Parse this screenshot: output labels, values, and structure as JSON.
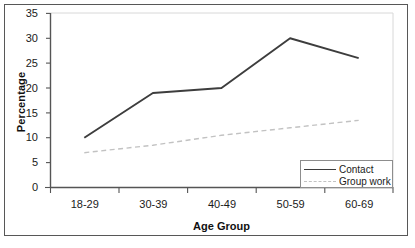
{
  "chart_data": {
    "type": "line",
    "title": "",
    "xlabel": "Age Group",
    "ylabel": "Percentage",
    "categories": [
      "18-29",
      "30-39",
      "40-49",
      "50-59",
      "60-69"
    ],
    "ylim": [
      0,
      35
    ],
    "yticks": [
      0,
      5,
      10,
      15,
      20,
      25,
      30,
      35
    ],
    "ytick_labels": [
      "0",
      "5",
      "10",
      "15",
      "20",
      "25",
      "30",
      "35"
    ],
    "grid": false,
    "legend_position": "bottom-right inside plot area",
    "series": [
      {
        "name": "Contact",
        "values": [
          10,
          19,
          20,
          30,
          26
        ],
        "color": "#3d3d3d",
        "style": "solid"
      },
      {
        "name": "Group work",
        "values": [
          7,
          8.5,
          10.5,
          12,
          13.5
        ],
        "color": "#c2c2c2",
        "style": "dashed"
      }
    ]
  },
  "axes": {
    "y_title": "Percentage",
    "x_title": "Age Group"
  },
  "legend": {
    "entries": [
      {
        "label": "Contact"
      },
      {
        "label": "Group work"
      }
    ]
  },
  "colors": {
    "contact_line": "#3d3d3d",
    "group_work_line": "#c2c2c2",
    "axis": "#555555",
    "frame": "#575757",
    "text": "#1a1a1a"
  }
}
